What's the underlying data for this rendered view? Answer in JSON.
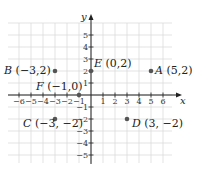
{
  "diagram": {
    "type": "coordinate-plane",
    "axes": {
      "x_label": "x",
      "y_label": "y",
      "x_range": [
        -6,
        6
      ],
      "y_range": [
        -5,
        5
      ]
    },
    "x_ticks": [
      "-6",
      "-5",
      "-4",
      "-3",
      "-2",
      "-1",
      "1",
      "2",
      "3",
      "4",
      "5",
      "6"
    ],
    "y_ticks": [
      "5",
      "4",
      "3",
      "2",
      "1",
      "-1",
      "-2",
      "-3",
      "-4",
      "-5"
    ],
    "points": [
      {
        "name": "A",
        "x": 5,
        "y": 2,
        "label": "A (5,2)"
      },
      {
        "name": "B",
        "x": -3,
        "y": 2,
        "label": "B (−3,2)"
      },
      {
        "name": "C",
        "x": -3,
        "y": -2,
        "label": "C (−3, −2)"
      },
      {
        "name": "D",
        "x": 3,
        "y": -2,
        "label": "D (3, −2)"
      },
      {
        "name": "E",
        "x": 0,
        "y": 2,
        "label": "E (0,2)"
      },
      {
        "name": "F",
        "x": -1,
        "y": 0,
        "label": "F (−1,0)"
      }
    ],
    "colors": {
      "grid": "#dcdcdc",
      "axis": "#222222",
      "point": "#555555"
    }
  }
}
